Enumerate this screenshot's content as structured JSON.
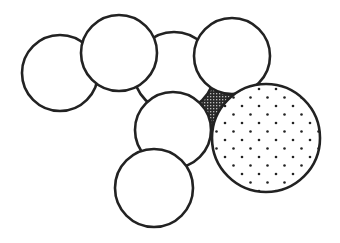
{
  "diagram": {
    "background": "#ffffff",
    "stroke_color": "#222222",
    "stroke_width": 2.6,
    "circles": [
      {
        "id": "circle-c-back",
        "cx": 174,
        "cy": 72,
        "r": 40,
        "fill": "plain"
      },
      {
        "id": "circle-a-left",
        "cx": 60,
        "cy": 73,
        "r": 38,
        "fill": "plain"
      },
      {
        "id": "circle-b-upper-left",
        "cx": 119,
        "cy": 53,
        "r": 38,
        "fill": "plain"
      },
      {
        "id": "circle-d-upper-right",
        "cx": 232,
        "cy": 56,
        "r": 38,
        "fill": "plain"
      },
      {
        "id": "circle-e-middle",
        "cx": 173,
        "cy": 130,
        "r": 38,
        "fill": "plain"
      },
      {
        "id": "circle-f-bottom",
        "cx": 154,
        "cy": 188,
        "r": 39,
        "fill": "plain"
      },
      {
        "id": "circle-g-dotted",
        "cx": 266,
        "cy": 138,
        "r": 54,
        "fill": "dotted"
      }
    ],
    "shaded_region": {
      "id": "interstitial-gap",
      "fill": "crosshatch",
      "color": "#333333"
    }
  }
}
